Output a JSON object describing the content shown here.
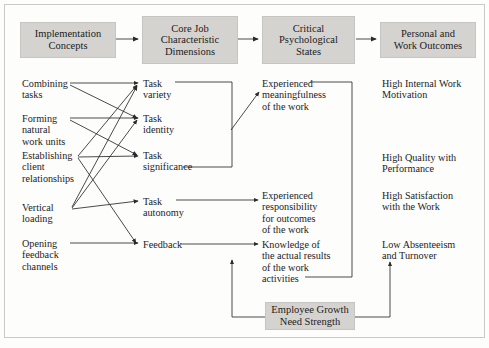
{
  "figure": {
    "header_boxes": [
      {
        "id": "implementation-concepts",
        "label": "Implementation\nConcepts"
      },
      {
        "id": "core-job-characteristic-dimensions",
        "label": "Core Job\nCharacteristic\nDimensions"
      },
      {
        "id": "critical-psychological-states",
        "label": "Critical\nPsychological\nStates"
      },
      {
        "id": "personal-and-work-outcomes",
        "label": "Personal and\nWork Outcomes"
      }
    ],
    "implementation_concepts": [
      {
        "id": "combining-tasks",
        "label": "Combining\ntasks"
      },
      {
        "id": "forming-natural-work-units",
        "label": "Forming\nnatural\nwork units"
      },
      {
        "id": "establishing-client-relationships",
        "label": "Establishing\nclient\nrelationships"
      },
      {
        "id": "vertical-loading",
        "label": "Vertical\nloading"
      },
      {
        "id": "opening-feedback-channels",
        "label": "Opening\nfeedback\nchannels"
      }
    ],
    "core_job_dimensions": [
      {
        "id": "task-variety",
        "label": "Task\nvariety"
      },
      {
        "id": "task-identity",
        "label": "Task\nidentity"
      },
      {
        "id": "task-significance",
        "label": "Task\nsignificance"
      },
      {
        "id": "task-autonomy",
        "label": "Task\nautonomy"
      },
      {
        "id": "feedback",
        "label": "Feedback"
      }
    ],
    "psychological_states": [
      {
        "id": "experienced-meaningfulness",
        "label": "Experienced\nmeaningfulness\nof the work"
      },
      {
        "id": "experienced-responsibility",
        "label": "Experienced\nresponsibility\nfor outcomes\nof the work"
      },
      {
        "id": "knowledge-of-results",
        "label": "Knowledge of\nthe actual results\nof the work\nactivities"
      }
    ],
    "outcomes": [
      {
        "id": "high-internal-work-motivation",
        "label": "High Internal Work\nMotivation"
      },
      {
        "id": "high-quality-with-performance",
        "label": "High Quality with\nPerformance"
      },
      {
        "id": "high-satisfaction-with-the-work",
        "label": "High Satisfaction\nwith the Work"
      },
      {
        "id": "low-absenteeism-and-turnover",
        "label": "Low Absenteeism\nand Turnover"
      }
    ],
    "moderator": {
      "id": "employee-growth-need-strength",
      "label": "Employee Growth\nNeed Strength"
    },
    "colors": {
      "box_fill": "#d4d3d0",
      "box_border": "#c6c5c2",
      "line": "#2b2b2b",
      "frame": "#c9c9c9",
      "text": "#1c1c1c",
      "background": "#fdfdfc"
    },
    "links": [
      {
        "from": "combining-tasks",
        "to": "task-variety"
      },
      {
        "from": "combining-tasks",
        "to": "task-identity"
      },
      {
        "from": "forming-natural-work-units",
        "to": "task-identity"
      },
      {
        "from": "forming-natural-work-units",
        "to": "task-significance"
      },
      {
        "from": "establishing-client-relationships",
        "to": "task-variety"
      },
      {
        "from": "establishing-client-relationships",
        "to": "task-significance"
      },
      {
        "from": "establishing-client-relationships",
        "to": "feedback"
      },
      {
        "from": "vertical-loading",
        "to": "task-variety"
      },
      {
        "from": "vertical-loading",
        "to": "task-identity"
      },
      {
        "from": "vertical-loading",
        "to": "task-autonomy"
      },
      {
        "from": "opening-feedback-channels",
        "to": "feedback"
      },
      {
        "from": "task-variety+task-identity+task-significance",
        "to": "experienced-meaningfulness"
      },
      {
        "from": "task-autonomy",
        "to": "experienced-responsibility"
      },
      {
        "from": "feedback",
        "to": "knowledge-of-results"
      },
      {
        "from": "employee-growth-need-strength",
        "to": "core-job-to-states-path"
      },
      {
        "from": "employee-growth-need-strength",
        "to": "states-to-outcomes-path"
      }
    ]
  }
}
